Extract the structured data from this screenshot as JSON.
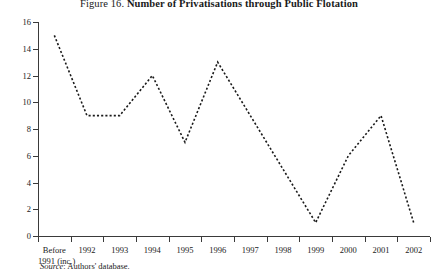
{
  "figure": {
    "number_label": "Figure 16.",
    "title": "Number of Privatisations through Public Flotation",
    "source_prefix": "Source",
    "source_text": ": Authors' database."
  },
  "axes": {
    "y_ticks": [
      "0",
      "2",
      "4",
      "6",
      "8",
      "10",
      "12",
      "14",
      "16"
    ],
    "y_min": 0,
    "y_max": 16,
    "y_step": 2,
    "x_labels": [
      {
        "line1": "Before",
        "line2": "1991 (inc.)"
      },
      {
        "line1": "1992",
        "line2": ""
      },
      {
        "line1": "1993",
        "line2": ""
      },
      {
        "line1": "1994",
        "line2": ""
      },
      {
        "line1": "1995",
        "line2": ""
      },
      {
        "line1": "1996",
        "line2": ""
      },
      {
        "line1": "1997",
        "line2": ""
      },
      {
        "line1": "1998",
        "line2": ""
      },
      {
        "line1": "1999",
        "line2": ""
      },
      {
        "line1": "2000",
        "line2": ""
      },
      {
        "line1": "2001",
        "line2": ""
      },
      {
        "line1": "2002",
        "line2": ""
      }
    ]
  },
  "style": {
    "line_color": "#1a1a1a",
    "axis_color": "#3a3a3a",
    "background": "#ffffff"
  },
  "chart_data": {
    "type": "line",
    "title": "Figure 16. Number of Privatisations through Public Flotation",
    "xlabel": "",
    "ylabel": "",
    "ylim": [
      0,
      16
    ],
    "grid": false,
    "legend": "none",
    "line_style": "dotted",
    "categories": [
      "Before 1991 (inc.)",
      "1992",
      "1993",
      "1994",
      "1995",
      "1996",
      "1997",
      "1998",
      "1999",
      "2000",
      "2001",
      "2002"
    ],
    "values": [
      15,
      9,
      9,
      12,
      7,
      13,
      9,
      5,
      1,
      6,
      9,
      1
    ],
    "source": "Source: Authors' database."
  }
}
